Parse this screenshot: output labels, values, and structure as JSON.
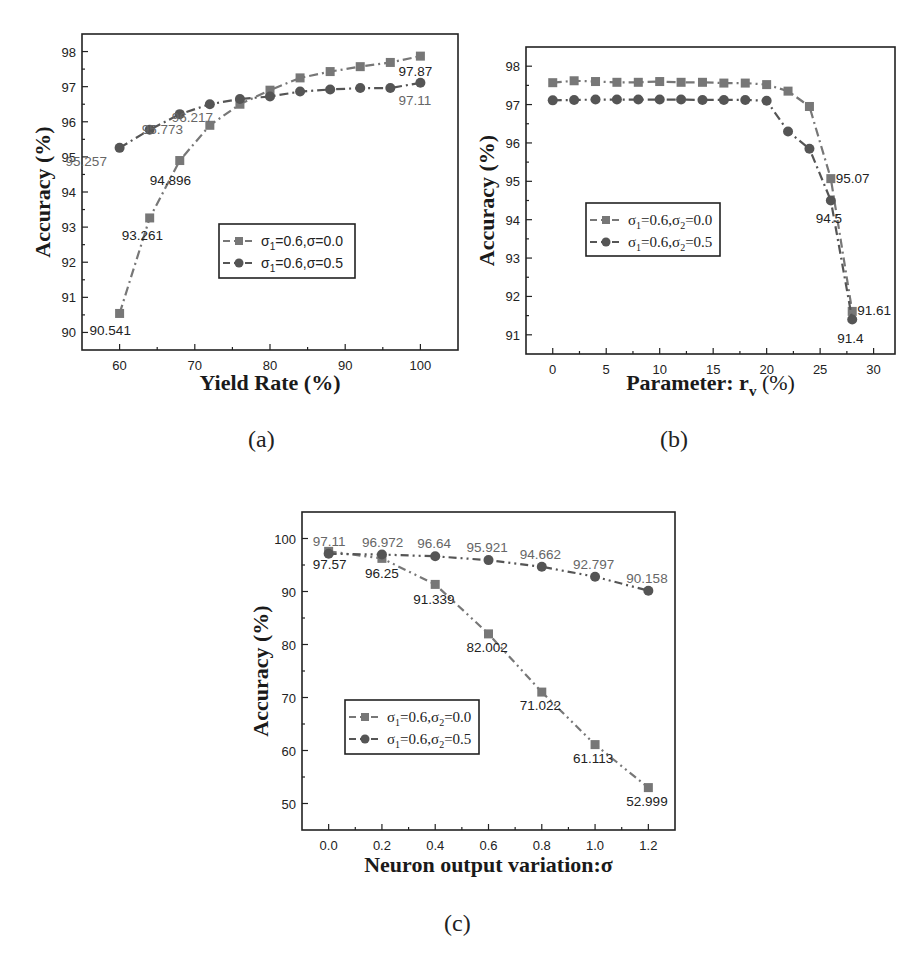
{
  "colors": {
    "square": "#777777",
    "circle": "#555555",
    "axis": "#222222",
    "label_dark": "#222222",
    "label_gray": "#666666"
  },
  "captions": {
    "a": "(a)",
    "b": "(b)",
    "c": "(c)"
  },
  "chart_data": [
    {
      "id": "a",
      "type": "line",
      "title": "",
      "xlabel": "Yield Rate (%)",
      "ylabel": "Accuracy (%)",
      "xlim": [
        55,
        105
      ],
      "ylim": [
        89.5,
        98.5
      ],
      "xticks": [
        60,
        70,
        80,
        90,
        100
      ],
      "yticks": [
        90,
        91,
        92,
        93,
        94,
        95,
        96,
        97,
        98
      ],
      "grid": false,
      "legend_position": "center-right",
      "x": [
        60,
        64,
        68,
        72,
        76,
        80,
        84,
        88,
        92,
        96,
        100
      ],
      "series": [
        {
          "name": "σ1=0.6,σ=0.0",
          "marker": "square",
          "values": [
            90.541,
            93.261,
            94.896,
            95.9,
            96.5,
            96.9,
            97.25,
            97.43,
            97.57,
            97.69,
            97.87
          ],
          "labels": {
            "0": "90.541",
            "1": "93.261",
            "2": "94.896",
            "10": "97.87"
          }
        },
        {
          "name": "σ1=0.6,σ=0.5",
          "marker": "circle",
          "values": [
            95.257,
            95.773,
            96.217,
            96.5,
            96.65,
            96.72,
            96.86,
            96.92,
            96.96,
            96.96,
            97.11
          ],
          "labels": {
            "0": "95.257",
            "1": "95.773",
            "2": "96.217",
            "10": "97.11"
          }
        }
      ]
    },
    {
      "id": "b",
      "type": "line",
      "title": "",
      "xlabel": "Parameter: r_v (%)",
      "ylabel": "Accuracy (%)",
      "xlim": [
        -2.5,
        32
      ],
      "ylim": [
        90.5,
        98.5
      ],
      "xticks": [
        0,
        5,
        10,
        15,
        20,
        25,
        30
      ],
      "yticks": [
        91,
        92,
        93,
        94,
        95,
        96,
        97,
        98
      ],
      "grid": false,
      "legend_position": "center-left",
      "x": [
        0,
        2,
        4,
        6,
        8,
        10,
        12,
        14,
        16,
        18,
        20,
        22,
        24,
        26,
        28
      ],
      "series": [
        {
          "name": "σ1=0.6,σ2=0.0",
          "marker": "square",
          "values": [
            97.57,
            97.62,
            97.6,
            97.58,
            97.58,
            97.6,
            97.58,
            97.58,
            97.56,
            97.56,
            97.52,
            97.35,
            96.95,
            95.07,
            91.61
          ],
          "labels": {
            "13": "95.07",
            "14": "91.61"
          }
        },
        {
          "name": "σ1=0.6,σ2=0.5",
          "marker": "circle",
          "values": [
            97.11,
            97.12,
            97.13,
            97.13,
            97.13,
            97.13,
            97.13,
            97.12,
            97.12,
            97.12,
            97.1,
            96.3,
            95.85,
            94.5,
            91.4
          ],
          "labels": {
            "13": "94.5",
            "14": "91.4"
          }
        }
      ]
    },
    {
      "id": "c",
      "type": "line",
      "title": "",
      "xlabel": "Neuron output variation:σ",
      "ylabel": "Accuracy (%)",
      "xlim": [
        -0.1,
        1.3
      ],
      "ylim": [
        45,
        105
      ],
      "xticks": [
        0.0,
        0.2,
        0.4,
        0.6,
        0.8,
        1.0,
        1.2
      ],
      "yticks": [
        50,
        60,
        70,
        80,
        90,
        100
      ],
      "grid": false,
      "legend_position": "center-left",
      "x": [
        0.0,
        0.2,
        0.4,
        0.6,
        0.8,
        1.0,
        1.2
      ],
      "series": [
        {
          "name": "σ1=0.6,σ2=0.0",
          "marker": "square",
          "values": [
            97.57,
            96.25,
            91.339,
            82.002,
            71.022,
            61.113,
            52.999
          ],
          "labels": {
            "0": "97.57",
            "1": "96.25",
            "2": "91.339",
            "3": "82.002",
            "4": "71.022",
            "5": "61.113",
            "6": "52.999"
          }
        },
        {
          "name": "σ1=0.6,σ2=0.5",
          "marker": "circle",
          "values": [
            97.11,
            96.972,
            96.64,
            95.921,
            94.662,
            92.797,
            90.158
          ],
          "labels": {
            "0": "97.11",
            "1": "96.972",
            "2": "96.64",
            "3": "95.921",
            "4": "94.662",
            "5": "92.797",
            "6": "90.158"
          }
        }
      ]
    }
  ],
  "legends": {
    "a": [
      {
        "sym": "σ",
        "sub": "1",
        "rest": "=0.6,σ=0.0"
      },
      {
        "sym": "σ",
        "sub": "1",
        "rest": "=0.6,σ=0.5"
      }
    ],
    "b": [
      {
        "sym": "σ",
        "sub": "1",
        "mid": "=0.6,σ",
        "sub2": "2",
        "rest": "=0.0"
      },
      {
        "sym": "σ",
        "sub": "1",
        "mid": "=0.6,σ",
        "sub2": "2",
        "rest": "=0.5"
      }
    ],
    "c": [
      {
        "sym": "σ",
        "sub": "1",
        "mid": "=0.6,σ",
        "sub2": "2",
        "rest": "=0.0"
      },
      {
        "sym": "σ",
        "sub": "1",
        "mid": "=0.6,σ",
        "sub2": "2",
        "rest": "=0.5"
      }
    ]
  },
  "axis_titles": {
    "a": {
      "x": "Yield Rate (%)",
      "y": "Accuracy (%)"
    },
    "b": {
      "x_main": "Parameter: r",
      "x_sub": "v",
      "x_tail": " (%)",
      "y": "Accuracy (%)"
    },
    "c": {
      "x": "Neuron output variation:σ",
      "y": "Accuracy (%)"
    }
  }
}
